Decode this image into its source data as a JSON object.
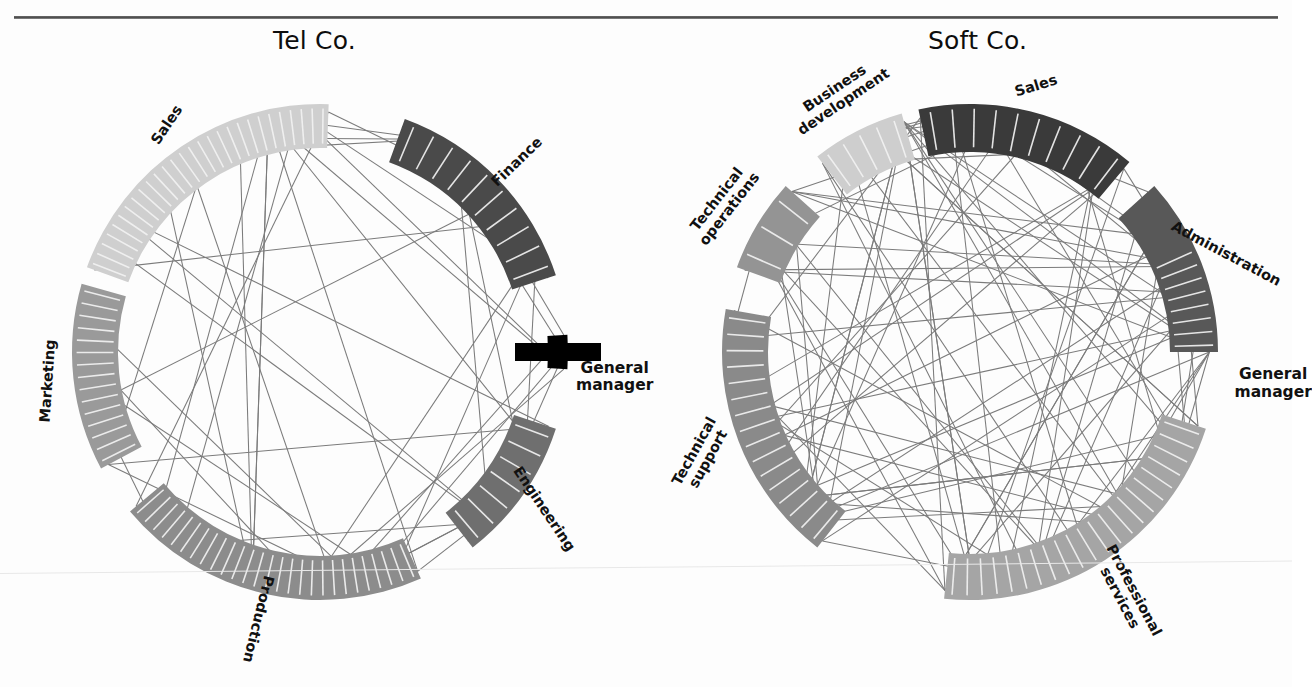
{
  "figure": {
    "kind": "circular-network-diagram-pair",
    "rule_color": "#4a4a4a",
    "background": "#fdfdfd",
    "general_manager_label": "General manager",
    "general_manager_line1": "General",
    "general_manager_line2": "manager"
  },
  "charts": [
    {
      "id": "tel-co",
      "title": "Tel Co.",
      "center": [
        320,
        352
      ],
      "radius": 248,
      "nodes": [
        {
          "name": "Sales",
          "start_deg": 200,
          "end_deg": 272,
          "segments": 28,
          "color": "#cfcfcf",
          "band": 44,
          "label_pos": "outer",
          "label_rot": -56,
          "solid_head": 0
        },
        {
          "name": "Finance",
          "start_deg": 290,
          "end_deg": 342,
          "segments": 10,
          "color": "#4a4a4a",
          "band": 46,
          "label_pos": "outer",
          "label_rot": -44,
          "solid_head": 0
        },
        {
          "name": "General manager",
          "start_deg": 356,
          "end_deg": 364,
          "segments": 1,
          "color": "#000000",
          "band": 20,
          "label_pos": "outer",
          "label_rot": 0,
          "solid_head": 1
        },
        {
          "name": "Engineering",
          "start_deg": 18,
          "end_deg": 52,
          "segments": 7,
          "color": "#6f6f6f",
          "band": 44,
          "label_pos": "outer",
          "label_rot": 56,
          "solid_head": 0
        },
        {
          "name": "Production",
          "start_deg": 66,
          "end_deg": 140,
          "segments": 27,
          "color": "#8c8c8c",
          "band": 44,
          "label_pos": "outer",
          "label_rot": 104,
          "solid_head": 0
        },
        {
          "name": "Marketing",
          "start_deg": 152,
          "end_deg": 196,
          "segments": 15,
          "color": "#9a9a9a",
          "band": 46,
          "label_pos": "outer",
          "label_rot": -86,
          "solid_head": 0
        }
      ],
      "chord_count": 52
    },
    {
      "id": "soft-co",
      "title": "Soft Co.",
      "center": [
        970,
        352
      ],
      "radius": 248,
      "nodes": [
        {
          "name": "Sales",
          "start_deg": 258,
          "end_deg": 310,
          "segments": 10,
          "color": "#3a3a3a",
          "band": 48,
          "label_pos": "outer",
          "label_rot": -17,
          "solid_head": 0
        },
        {
          "name": "Administration",
          "start_deg": 318,
          "end_deg": 360,
          "segments": 13,
          "color": "#585858",
          "band": 48,
          "label_pos": "outer",
          "label_rot": 28,
          "solid_head": 5
        },
        {
          "name": "General manager",
          "start_deg": 364,
          "end_deg": 368,
          "segments": 0,
          "color": "#000000",
          "band": 0,
          "label_pos": "outer",
          "label_rot": 0,
          "solid_head": 0
        },
        {
          "name": "Professional services",
          "start_deg": 18,
          "end_deg": 96,
          "segments": 22,
          "color": "#a5a5a5",
          "band": 46,
          "label_pos": "outer",
          "label_rot": 62,
          "solid_head": 0
        },
        {
          "name": "Technical support",
          "start_deg": 128,
          "end_deg": 190,
          "segments": 16,
          "color": "#8a8a8a",
          "band": 46,
          "label_pos": "outer",
          "label_rot": -61,
          "solid_head": 0
        },
        {
          "name": "Technical operations",
          "start_deg": 200,
          "end_deg": 222,
          "segments": 3,
          "color": "#949494",
          "band": 46,
          "label_pos": "outer",
          "label_rot": -52,
          "solid_head": 0
        },
        {
          "name": "Business development",
          "start_deg": 232,
          "end_deg": 254,
          "segments": 5,
          "color": "#cecece",
          "band": 48,
          "label_pos": "outer",
          "label_rot": -34,
          "solid_head": 0
        }
      ],
      "chord_count": 96
    }
  ],
  "chart_data": {
    "type": "network",
    "panels": [
      {
        "title": "Tel Co.",
        "units": [
          "Sales",
          "Finance",
          "General manager",
          "Engineering",
          "Production",
          "Marketing"
        ],
        "unit_sizes": [
          28,
          10,
          1,
          7,
          27,
          15
        ],
        "unit_shades": [
          "#cfcfcf",
          "#4a4a4a",
          "#000000",
          "#6f6f6f",
          "#8c8c8c",
          "#9a9a9a"
        ],
        "tie_count": 52,
        "note": "Arc length proportional to number of employees in the unit; chords are reported communication ties"
      },
      {
        "title": "Soft Co.",
        "units": [
          "Sales",
          "Administration",
          "General manager",
          "Professional services",
          "Technical support",
          "Technical operations",
          "Business development"
        ],
        "unit_sizes": [
          10,
          13,
          1,
          22,
          16,
          3,
          5
        ],
        "unit_shades": [
          "#3a3a3a",
          "#585858",
          "#000000",
          "#a5a5a5",
          "#8a8a8a",
          "#949494",
          "#cecece"
        ],
        "tie_count": 96,
        "note": "Arc length proportional to number of employees in the unit; chords are reported communication ties"
      }
    ],
    "legend": null,
    "xlabel": "",
    "ylabel": ""
  }
}
